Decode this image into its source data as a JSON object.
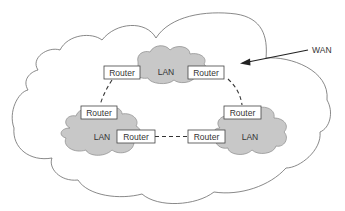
{
  "diagram": {
    "type": "network-topology",
    "wan": {
      "label": "WAN",
      "colors": {
        "stroke": "#6b6b6b",
        "fill": "#ffffff"
      }
    },
    "lans": [
      {
        "id": "lan-top",
        "label": "LAN"
      },
      {
        "id": "lan-left",
        "label": "LAN"
      },
      {
        "id": "lan-right",
        "label": "LAN"
      }
    ],
    "routers": [
      {
        "id": "router-top-left",
        "label": "Router",
        "lan": "lan-top"
      },
      {
        "id": "router-top-right",
        "label": "Router",
        "lan": "lan-top"
      },
      {
        "id": "router-left-top",
        "label": "Router",
        "lan": "lan-left"
      },
      {
        "id": "router-left-right",
        "label": "Router",
        "lan": "lan-left"
      },
      {
        "id": "router-right-top",
        "label": "Router",
        "lan": "lan-right"
      },
      {
        "id": "router-right-left",
        "label": "Router",
        "lan": "lan-right"
      }
    ],
    "links": [
      {
        "from": "router-top-left",
        "to": "router-left-top",
        "style": "dashed"
      },
      {
        "from": "router-top-right",
        "to": "router-right-top",
        "style": "dashed"
      },
      {
        "from": "router-left-right",
        "to": "router-right-left",
        "style": "dashed"
      }
    ],
    "colors": {
      "lan_fill": "#c8c8c8",
      "lan_stroke": "#8a8a8a",
      "router_fill": "#ffffff",
      "router_stroke": "#444444",
      "link": "#333333",
      "text": "#333333"
    }
  }
}
